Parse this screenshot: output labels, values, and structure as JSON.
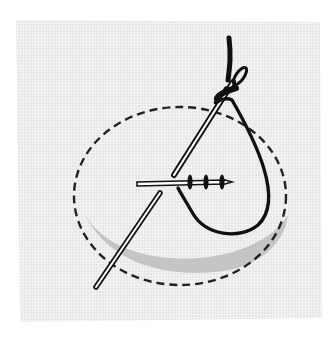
{
  "illustration": {
    "subject": "Needle and thread stitching through fabric",
    "elements": [
      "fabric-swatch",
      "dashed-outline-ellipse",
      "shadow-region",
      "needle-upper",
      "needle-lower",
      "needle-horizontal",
      "thread-loop",
      "thread-knots"
    ],
    "colors": {
      "background": "#ffffff",
      "fabric": "#eeeeee",
      "fabric_dots": "#d6d6d6",
      "shadow": "#b8b8b8",
      "ink": "#111111"
    }
  }
}
